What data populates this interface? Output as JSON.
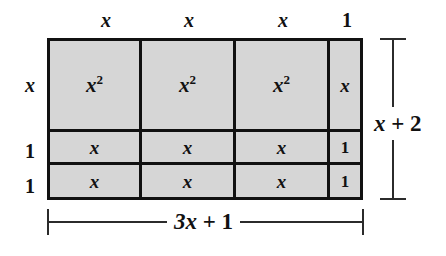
{
  "diagram": {
    "type": "algebra-tiles-area-model",
    "fill_color": "#d6d6d6",
    "line_color": "#111111",
    "background_color": "#ffffff",
    "top_labels": [
      "x",
      "x",
      "x",
      "1"
    ],
    "left_labels": [
      "x",
      "1",
      "1"
    ],
    "rows": [
      {
        "row_label": "x",
        "cells": [
          {
            "text": "x",
            "exponent": "2"
          },
          {
            "text": "x",
            "exponent": "2"
          },
          {
            "text": "x",
            "exponent": "2"
          },
          {
            "text": "x",
            "exponent": ""
          }
        ]
      },
      {
        "row_label": "1",
        "cells": [
          {
            "text": "x",
            "exponent": ""
          },
          {
            "text": "x",
            "exponent": ""
          },
          {
            "text": "x",
            "exponent": ""
          },
          {
            "text": "1",
            "exponent": ""
          }
        ]
      },
      {
        "row_label": "1",
        "cells": [
          {
            "text": "x",
            "exponent": ""
          },
          {
            "text": "x",
            "exponent": ""
          },
          {
            "text": "x",
            "exponent": ""
          },
          {
            "text": "1",
            "exponent": ""
          }
        ]
      }
    ],
    "dimensions": {
      "bottom": {
        "variable": "3x",
        "operator": "+",
        "constant": "1"
      },
      "right": {
        "variable": "x",
        "operator": "+",
        "constant": "2"
      }
    }
  }
}
